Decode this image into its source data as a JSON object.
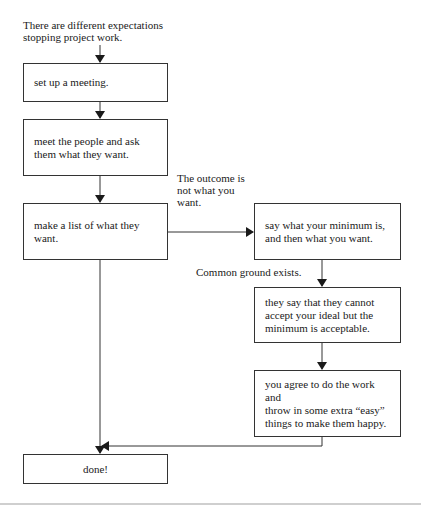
{
  "diagram": {
    "type": "flowchart",
    "start_label": "There are different expectations\nstopping project work.",
    "nodes": [
      {
        "id": "setup",
        "text": "set up a meeting."
      },
      {
        "id": "meet",
        "text": "meet the people and ask\nthem what they want."
      },
      {
        "id": "list",
        "text": "make a list of what they want."
      },
      {
        "id": "minimum",
        "text": "say what your minimum is,\nand then what you want."
      },
      {
        "id": "accept",
        "text": "they say that they cannot\naccept your ideal but the\nminimum is acceptable."
      },
      {
        "id": "agree",
        "text": "you agree to do the work and\nthrow in some extra “easy”\nthings to make them happy."
      },
      {
        "id": "done",
        "text": "done!"
      }
    ],
    "edge_labels": {
      "outcome_not_wanted": "The outcome is\nnot what you\nwant.",
      "common_ground": "Common ground exists."
    },
    "edges": [
      {
        "from": "start",
        "to": "setup"
      },
      {
        "from": "setup",
        "to": "meet"
      },
      {
        "from": "meet",
        "to": "list"
      },
      {
        "from": "list",
        "to": "minimum",
        "label": "The outcome is not what you want."
      },
      {
        "from": "minimum",
        "to": "accept",
        "label": "Common ground exists."
      },
      {
        "from": "accept",
        "to": "agree"
      },
      {
        "from": "agree",
        "to": "done"
      },
      {
        "from": "list",
        "to": "done"
      }
    ],
    "colors": {
      "line": "#333333",
      "background": "#ffffff",
      "text": "#1a1a1a"
    }
  }
}
